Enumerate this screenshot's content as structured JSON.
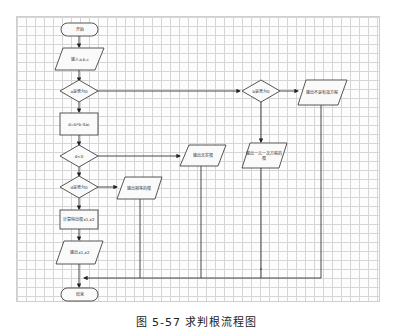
{
  "diagram": {
    "type": "flowchart",
    "nodes": {
      "start": "开始",
      "input": "输入a,b,c",
      "dec_a_zero": "a是否为0",
      "calc_delta": "d=b*b-4ac",
      "dec_d": "d<0",
      "dec_d_zero": "d是否为0",
      "calc_roots": "计算得出根x1,x2",
      "output_roots": "输出x1,x2",
      "end": "结束",
      "dec_b_zero": "b是否为0",
      "out_not_equation": "输出不是有效方程",
      "out_no_real": "输出无实根",
      "out_equal_roots": "输出相等的根",
      "out_linear_root": "输出一元一次方程的根"
    },
    "edges": [
      [
        "start",
        "input"
      ],
      [
        "input",
        "dec_a_zero"
      ],
      [
        "dec_a_zero",
        "calc_delta"
      ],
      [
        "dec_a_zero",
        "dec_b_zero"
      ],
      [
        "dec_b_zero",
        "out_not_equation"
      ],
      [
        "dec_b_zero",
        "out_linear_root"
      ],
      [
        "calc_delta",
        "dec_d"
      ],
      [
        "dec_d",
        "out_no_real"
      ],
      [
        "dec_d",
        "dec_d_zero"
      ],
      [
        "dec_d_zero",
        "out_equal_roots"
      ],
      [
        "dec_d_zero",
        "calc_roots"
      ],
      [
        "calc_roots",
        "output_roots"
      ],
      [
        "output_roots",
        "end"
      ]
    ]
  },
  "caption": "图 5-57 求判根流程图"
}
